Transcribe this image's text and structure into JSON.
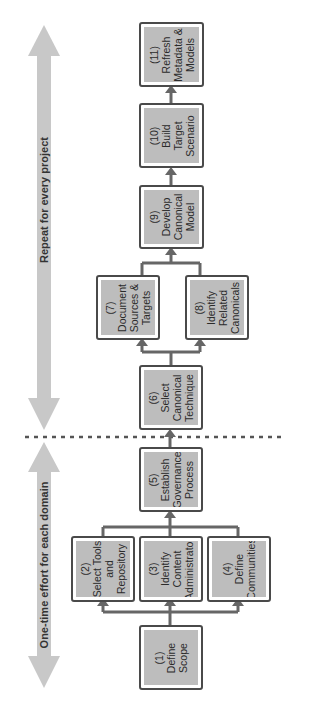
{
  "diagram": {
    "orientation": "rotated 90 degrees counter-clockwise",
    "phases": [
      {
        "id": "one-time",
        "label": "One-time effort for each domain"
      },
      {
        "id": "repeat",
        "label": "Repeat for every project"
      }
    ],
    "steps": [
      {
        "num": "(1)",
        "text": "Define\nScope"
      },
      {
        "num": "(2)",
        "text": "Select Tools\nand\nRepository"
      },
      {
        "num": "(3)",
        "text": "Identify\nContent\nAdministrator"
      },
      {
        "num": "(4)",
        "text": "Define\nCommunities"
      },
      {
        "num": "(5)",
        "text": "Establish\nGovernance\nProcess"
      },
      {
        "num": "(6)",
        "text": "Select\nCanonical\nTechnique"
      },
      {
        "num": "(7)",
        "text": "Document\nSources &\nTargets"
      },
      {
        "num": "(8)",
        "text": "Identify\nRelated\nCanonicals"
      },
      {
        "num": "(9)",
        "text": "Develop\nCanonical\nModel"
      },
      {
        "num": "(10)",
        "text": "Build\nTarget\nScenario"
      },
      {
        "num": "(11)",
        "text": "Refresh\nMetadata &\nModels"
      }
    ],
    "flow": [
      [
        "(1)",
        "(2)"
      ],
      [
        "(1)",
        "(3)"
      ],
      [
        "(1)",
        "(4)"
      ],
      [
        "(2)",
        "(5)"
      ],
      [
        "(3)",
        "(5)"
      ],
      [
        "(4)",
        "(5)"
      ],
      [
        "(5)",
        "(6)"
      ],
      [
        "(6)",
        "(7)"
      ],
      [
        "(6)",
        "(8)"
      ],
      [
        "(7)",
        "(9)"
      ],
      [
        "(8)",
        "(9)"
      ],
      [
        "(9)",
        "(10)"
      ],
      [
        "(10)",
        "(11)"
      ]
    ],
    "colors": {
      "box_fill": "#bdbdbd",
      "box_border": "#4a4a4a",
      "connector": "#666666",
      "phase_arrow": "#c8c8c8",
      "divider": "#555555"
    }
  },
  "labels": {
    "s1": "(1)\nDefine\nScope",
    "s2": "(2)\nSelect Tools\nand\nRepository",
    "s3": "(3)\nIdentify\nContent\nAdministrator",
    "s4": "(4)\nDefine\nCommunities",
    "s5": "(5)\nEstablish\nGovernance\nProcess",
    "s6": "(6)\nSelect\nCanonical\nTechnique",
    "s7": "(7)\nDocument\nSources &\nTargets",
    "s8": "(8)\nIdentify\nRelated\nCanonicals",
    "s9": "(9)\nDevelop\nCanonical\nModel",
    "s10": "(10)\nBuild\nTarget\nScenario",
    "s11": "(11)\nRefresh\nMetadata &\nModels",
    "phase_repeat": "Repeat for every project",
    "phase_onetime": "One-time effort for each domain"
  }
}
